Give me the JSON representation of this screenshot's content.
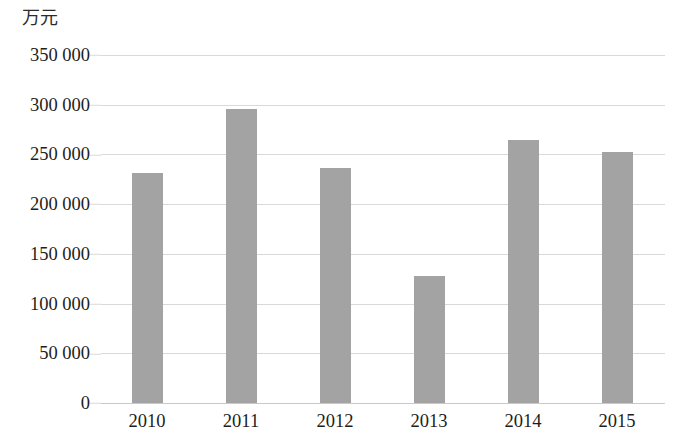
{
  "chart_data": {
    "type": "bar",
    "title": "",
    "subtitle": "",
    "xlabel": "",
    "ylabel": "万元",
    "categories": [
      "2010",
      "2011",
      "2012",
      "2013",
      "2014",
      "2015"
    ],
    "values": [
      231000,
      296000,
      236000,
      128000,
      265000,
      252000
    ],
    "series": [
      {
        "name": "",
        "values": [
          231000,
          296000,
          236000,
          128000,
          265000,
          252000
        ]
      }
    ],
    "ylim": [
      0,
      350000
    ],
    "ytick_values": [
      0,
      50000,
      100000,
      150000,
      200000,
      250000,
      300000,
      350000
    ],
    "ytick_labels": [
      "0",
      "50 000",
      "100 000",
      "150 000",
      "200 000",
      "250 000",
      "300 000",
      "350 000"
    ],
    "grid": "horizontal",
    "legend": "none",
    "bar_color": "#a3a3a3",
    "gridline_color": "#d9d9d9",
    "background_color": "#ffffff",
    "text_color": "#1d1d1d"
  }
}
